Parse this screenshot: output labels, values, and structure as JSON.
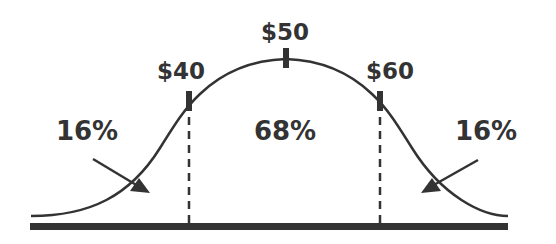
{
  "colors": {
    "ink": "#333333",
    "background": "#ffffff"
  },
  "markers": {
    "lower": {
      "label": "$40",
      "value": 40
    },
    "mean": {
      "label": "$50",
      "value": 50
    },
    "upper": {
      "label": "$60",
      "value": 60
    }
  },
  "regions": {
    "left_tail": {
      "label": "16%",
      "percent": 16
    },
    "center": {
      "label": "68%",
      "percent": 68
    },
    "right_tail": {
      "label": "16%",
      "percent": 16
    }
  }
}
